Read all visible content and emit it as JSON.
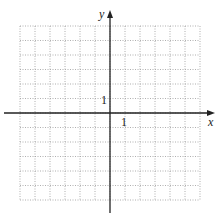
{
  "diagram": {
    "type": "coordinate-grid",
    "axes": {
      "x_label": "x",
      "y_label": "y",
      "x_tick_label": "1",
      "y_tick_label": "1"
    },
    "grid": {
      "columns": 12,
      "rows": 12,
      "x_range": [
        -6,
        6
      ],
      "y_range": [
        -6,
        6
      ],
      "line_style": "dotted",
      "line_color": "#9a9a9a"
    },
    "colors": {
      "axis": "#222222",
      "background": "#ffffff"
    }
  }
}
